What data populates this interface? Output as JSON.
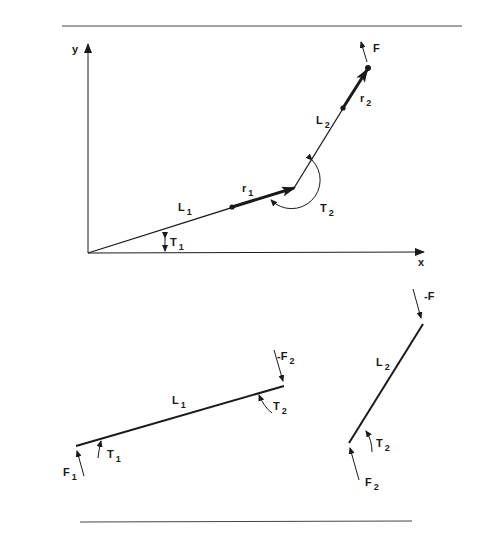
{
  "figure": {
    "colors": {
      "ink": "#1a1a1a",
      "rule": "#444444",
      "background": "#ffffff"
    }
  },
  "rules": {
    "top": {
      "x1": 62,
      "y1": 26,
      "x2": 462,
      "y2": 26
    },
    "bottom": {
      "x1": 80,
      "y1": 522,
      "x2": 412,
      "y2": 521
    }
  },
  "top_diagram": {
    "axes": {
      "origin": [
        88,
        253
      ],
      "y_axis_end": [
        88,
        42
      ],
      "x_axis_end": [
        424,
        252
      ],
      "y_label": "y",
      "x_label": "x"
    },
    "link1": {
      "start": [
        88,
        253
      ],
      "end": [
        294,
        188
      ],
      "label": "L",
      "label_sub": "1",
      "label_pos": [
        178,
        207
      ]
    },
    "link2": {
      "start": [
        294,
        188
      ],
      "end": [
        368,
        68
      ],
      "label": "L",
      "label_sub": "2",
      "label_pos": [
        318,
        128
      ]
    },
    "r1": {
      "start": [
        232,
        207
      ],
      "end": [
        294,
        188
      ],
      "label": "r",
      "label_sub": "1",
      "label_pos": [
        242,
        192
      ]
    },
    "r2": {
      "start": [
        343,
        108
      ],
      "end": [
        368,
        68
      ],
      "label": "r",
      "label_sub": "2",
      "label_pos": [
        361,
        104
      ]
    },
    "force": {
      "start": [
        367,
        62
      ],
      "end": [
        361,
        42
      ],
      "label": "F",
      "label_pos": [
        373,
        50
      ]
    },
    "t1": {
      "label": "T",
      "label_sub": "1",
      "label_pos": [
        170,
        244
      ]
    },
    "t2": {
      "label": "T",
      "label_sub": "2",
      "label_pos": [
        318,
        208
      ]
    }
  },
  "bottom_left": {
    "link": {
      "start": [
        76,
        446
      ],
      "end": [
        284,
        386
      ],
      "label": "L",
      "label_sub": "1",
      "label_pos": [
        172,
        400
      ]
    },
    "f1": {
      "label": "F",
      "label_sub": "1",
      "label_pos": [
        64,
        474
      ]
    },
    "t1": {
      "label": "T",
      "label_sub": "1",
      "label_pos": [
        106,
        456
      ]
    },
    "minus_f2": {
      "label": "-F",
      "label_sub": "2",
      "label_pos": [
        276,
        356
      ]
    },
    "t2": {
      "label": "T",
      "label_sub": "2",
      "label_pos": [
        272,
        410
      ]
    }
  },
  "bottom_right": {
    "link": {
      "start": [
        349,
        443
      ],
      "end": [
        423,
        324
      ],
      "label": "L",
      "label_sub": "2",
      "label_pos": [
        376,
        368
      ]
    },
    "minus_f": {
      "label": "-F",
      "label_pos": [
        424,
        294
      ]
    },
    "t2": {
      "label": "T",
      "label_sub": "2",
      "label_pos": [
        375,
        445
      ]
    },
    "f2": {
      "label": "F",
      "label_sub": "2",
      "label_pos": [
        364,
        484
      ]
    }
  }
}
